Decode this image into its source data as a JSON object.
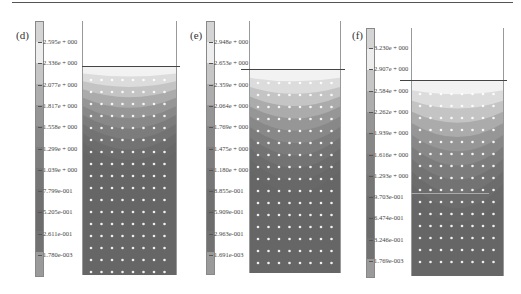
{
  "figure": {
    "panels": [
      {
        "label": "(d)",
        "colorbar_ticks": [
          "2.595e + 000",
          "2.336e + 000",
          "2.077e + 000",
          "1.817e + 000",
          "1.558e + 000",
          "1.299e + 000",
          "1.039e + 000",
          "7.799e-001",
          "5.205e-001",
          "2.611e-001",
          "1.780e-003"
        ]
      },
      {
        "label": "(e)",
        "colorbar_ticks": [
          "2.948e + 000",
          "2.653e + 000",
          "2.359e + 000",
          "2.064e + 000",
          "1.769e + 000",
          "1.475e + 000",
          "1.180e + 000",
          "8.855e-001",
          "5.909e-001",
          "2.963e-001",
          "1.691e-003"
        ]
      },
      {
        "label": "(f)",
        "colorbar_ticks": [
          "3.230e + 000",
          "2.907e + 000",
          "2.584e + 000",
          "2.262e + 000",
          "1.939e + 000",
          "1.616e + 000",
          "1.293e + 000",
          "9.703e-001",
          "6.474e-001",
          "3.246e-001",
          "1.769e-003"
        ]
      }
    ]
  },
  "chart_data": [
    {
      "type": "heatmap",
      "title": "(d)",
      "colorbar_levels": [
        2.595,
        2.336,
        2.077,
        1.817,
        1.558,
        1.299,
        1.039,
        0.7799,
        0.5205,
        0.2611,
        0.00178
      ],
      "colorbar_range": [
        0.00178,
        2.595
      ],
      "surface_line": true,
      "description": "Bowl-shaped contour field: highest values near top center, decreasing with depth; grid of white node markers"
    },
    {
      "type": "heatmap",
      "title": "(e)",
      "colorbar_levels": [
        2.948,
        2.653,
        2.359,
        2.064,
        1.769,
        1.475,
        1.18,
        0.8855,
        0.5909,
        0.2963,
        0.001691
      ],
      "colorbar_range": [
        0.001691,
        2.948
      ],
      "surface_line": true,
      "description": "Bowl-shaped contour field extending deeper than (d); grid of white node markers"
    },
    {
      "type": "heatmap",
      "title": "(f)",
      "colorbar_levels": [
        3.23,
        2.907,
        2.584,
        2.262,
        1.939,
        1.616,
        1.293,
        0.9703,
        0.6474,
        0.3246,
        0.001769
      ],
      "colorbar_range": [
        0.001769,
        3.23
      ],
      "surface_line": true,
      "secondary_line_at": 0.9703,
      "description": "Bowl-shaped contour field extending deepest; horizontal line near 9.703e-001 level; grid of node markers"
    }
  ],
  "colors": {
    "shades": [
      "#d8d8d8",
      "#ececec",
      "#f4f4f4",
      "#c9c9c9",
      "#b0b0b0",
      "#9c9c9c",
      "#8c8c8c",
      "#808080",
      "#757575",
      "#6d6d6d",
      "#686868",
      "#9a9a9a"
    ]
  }
}
